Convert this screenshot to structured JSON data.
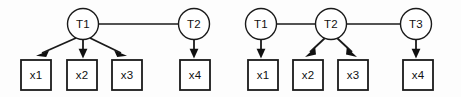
{
  "figure": {
    "title": "",
    "background_color": "#fdfdfd",
    "stroke_color": "#1a1a1a",
    "fill_color": "#ffffff",
    "width": 461,
    "height": 97
  },
  "diagrams": [
    {
      "id": "left-model",
      "latent_nodes": [
        {
          "id": "L-T1",
          "label": "T1",
          "cx": 83,
          "cy": 24,
          "r": 15.5
        },
        {
          "id": "L-T2",
          "label": "T2",
          "cx": 194,
          "cy": 24,
          "r": 15.5
        }
      ],
      "observed_nodes": [
        {
          "id": "L-x1",
          "label": "x1",
          "x": 21,
          "y": 60,
          "w": 30,
          "h": 30
        },
        {
          "id": "L-x2",
          "label": "x2",
          "x": 67,
          "y": 60,
          "w": 30,
          "h": 30
        },
        {
          "id": "L-x3",
          "label": "x3",
          "x": 112,
          "y": 60,
          "w": 30,
          "h": 30
        },
        {
          "id": "L-x4",
          "label": "x4",
          "x": 180,
          "y": 60,
          "w": 30,
          "h": 30
        }
      ],
      "undirected_links": [
        {
          "from": "L-T1",
          "to": "L-T2"
        }
      ],
      "directed_arrows": [
        {
          "from": "L-T1",
          "to": "L-x1"
        },
        {
          "from": "L-T1",
          "to": "L-x2"
        },
        {
          "from": "L-T1",
          "to": "L-x3"
        },
        {
          "from": "L-T2",
          "to": "L-x4"
        }
      ]
    },
    {
      "id": "right-model",
      "latent_nodes": [
        {
          "id": "R-T1",
          "label": "T1",
          "cx": 261,
          "cy": 24,
          "r": 15.5
        },
        {
          "id": "R-T2",
          "label": "T2",
          "cx": 331,
          "cy": 24,
          "r": 15.5
        },
        {
          "id": "R-T3",
          "label": "T3",
          "cx": 416,
          "cy": 24,
          "r": 15.5
        }
      ],
      "observed_nodes": [
        {
          "id": "R-x1",
          "label": "x1",
          "x": 248,
          "y": 60,
          "w": 30,
          "h": 30
        },
        {
          "id": "R-x2",
          "label": "x2",
          "x": 293,
          "y": 60,
          "w": 30,
          "h": 30
        },
        {
          "id": "R-x3",
          "label": "x3",
          "x": 338,
          "y": 60,
          "w": 30,
          "h": 30
        },
        {
          "id": "R-x4",
          "label": "x4",
          "x": 403,
          "y": 60,
          "w": 30,
          "h": 30
        }
      ],
      "undirected_links": [
        {
          "from": "R-T1",
          "to": "R-T2"
        },
        {
          "from": "R-T2",
          "to": "R-T3"
        }
      ],
      "directed_arrows": [
        {
          "from": "R-T1",
          "to": "R-x1"
        },
        {
          "from": "R-T2",
          "to": "R-x2"
        },
        {
          "from": "R-T2",
          "to": "R-x3"
        },
        {
          "from": "R-T3",
          "to": "R-x4"
        }
      ]
    }
  ],
  "labels": {
    "left": {
      "t1": "T1",
      "t2": "T2",
      "x1": "x1",
      "x2": "x2",
      "x3": "x3",
      "x4": "x4"
    },
    "right": {
      "t1": "T1",
      "t2": "T2",
      "t3": "T3",
      "x1": "x1",
      "x2": "x2",
      "x3": "x3",
      "x4": "x4"
    }
  }
}
